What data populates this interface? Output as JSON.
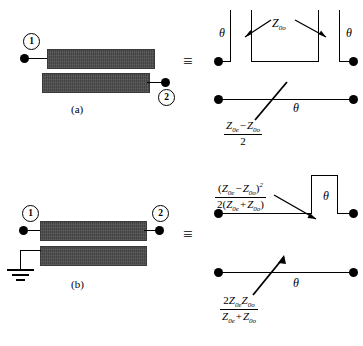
{
  "figure": {
    "type": "coupled-line-equivalent-circuits",
    "equivalence_symbol": "≡",
    "captions": {
      "a": "(a)",
      "b": "(b)"
    },
    "ports": {
      "one": "1",
      "two": "2"
    },
    "theta": "θ"
  },
  "panel_a": {
    "caption": "(a)",
    "port_labels": [
      "1",
      "2"
    ],
    "description": "Two offset coupled microstrip bars; port 1 at left of upper bar, port 2 at right of lower bar",
    "equiv_circuit": {
      "stub_label": {
        "symbol": "Z",
        "subscript": "0o",
        "full": "Z₀ₒ"
      },
      "theta_left": "θ",
      "theta_right": "θ",
      "series_line_theta": "θ",
      "impedance_formula": {
        "numerator_terms": [
          "Z",
          "0e",
          "−",
          "Z",
          "0o"
        ],
        "numerator_plain": "Z₀ₑ − Z₀ₒ",
        "denominator_plain": "2"
      }
    }
  },
  "panel_b": {
    "caption": "(b)",
    "port_labels": [
      "1",
      "2"
    ],
    "ground_symbol": "ground",
    "description": "Two aligned coupled microstrip bars; ports 1 and 2 on upper bar, lower bar grounded at left",
    "equiv_circuit": {
      "stub_formula": {
        "numerator_plain": "(Z₀ₑ − Z₀ₒ)²",
        "denominator_plain": "2(Z₀ₑ + Z₀ₒ)"
      },
      "stub_theta": "θ",
      "series_line_theta": "θ",
      "line_impedance_formula": {
        "numerator_plain": "2Z₀ₑZ₀ₒ",
        "denominator_plain": "Z₀ₑ + Z₀ₒ"
      }
    }
  },
  "symbols": {
    "Z": "Z",
    "sub_0e": "0e",
    "sub_0o": "0o",
    "minus": "−",
    "plus": "+",
    "two": "2",
    "squared": "2",
    "lparen": "(",
    "rparen": ")"
  }
}
